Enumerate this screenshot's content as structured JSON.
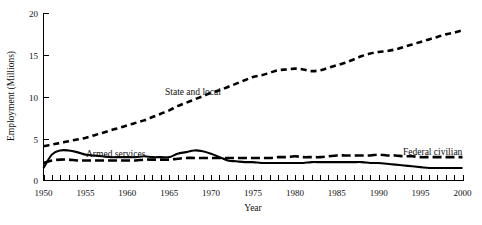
{
  "chart_data": {
    "type": "line",
    "title": "",
    "xlabel": "Year",
    "ylabel": "Employment (Millions)",
    "xlim": [
      1950,
      2000
    ],
    "ylim": [
      0,
      20
    ],
    "grid": false,
    "legend_position": "inline-annotations",
    "x_ticks_major": [
      1950,
      1955,
      1960,
      1965,
      1970,
      1975,
      1980,
      1985,
      1990,
      1995,
      2000
    ],
    "x_ticks_minor_step": 1,
    "y_ticks": [
      0,
      5,
      10,
      15,
      20
    ],
    "x_tick_labels": [
      "1950",
      "1955",
      "1960",
      "1965",
      "1970",
      "1975",
      "1980",
      "1985",
      "1990",
      "1995",
      "2000"
    ],
    "y_tick_labels": [
      "0",
      "5",
      "10",
      "15",
      "20"
    ],
    "x": [
      1950,
      1951,
      1952,
      1953,
      1954,
      1955,
      1956,
      1957,
      1958,
      1959,
      1960,
      1961,
      1962,
      1963,
      1964,
      1965,
      1966,
      1967,
      1968,
      1969,
      1970,
      1971,
      1972,
      1973,
      1974,
      1975,
      1976,
      1977,
      1978,
      1979,
      1980,
      1981,
      1982,
      1983,
      1984,
      1985,
      1986,
      1987,
      1988,
      1989,
      1990,
      1991,
      1992,
      1993,
      1994,
      1995,
      1996,
      1997,
      1998,
      1999,
      2000
    ],
    "series": [
      {
        "name": "State and local",
        "style": "dashed",
        "annotation": "State and local",
        "values": [
          4.1,
          4.3,
          4.5,
          4.7,
          4.9,
          5.1,
          5.4,
          5.7,
          6.0,
          6.3,
          6.6,
          6.9,
          7.2,
          7.6,
          8.0,
          8.4,
          8.9,
          9.3,
          9.7,
          10.1,
          10.5,
          10.8,
          11.2,
          11.6,
          12.0,
          12.4,
          12.6,
          12.9,
          13.2,
          13.3,
          13.4,
          13.3,
          13.1,
          13.2,
          13.5,
          13.8,
          14.1,
          14.5,
          14.9,
          15.2,
          15.4,
          15.5,
          15.7,
          16.0,
          16.3,
          16.6,
          16.9,
          17.2,
          17.5,
          17.7,
          18.0
        ]
      },
      {
        "name": "Armed services",
        "style": "solid",
        "annotation": "Armed services",
        "values": [
          1.5,
          3.1,
          3.6,
          3.6,
          3.4,
          3.1,
          3.0,
          2.9,
          2.8,
          2.8,
          2.8,
          2.8,
          2.9,
          2.8,
          2.8,
          2.8,
          3.2,
          3.4,
          3.6,
          3.5,
          3.2,
          2.8,
          2.4,
          2.3,
          2.2,
          2.2,
          2.1,
          2.1,
          2.1,
          2.1,
          2.1,
          2.1,
          2.2,
          2.2,
          2.2,
          2.2,
          2.2,
          2.2,
          2.2,
          2.1,
          2.1,
          2.0,
          1.9,
          1.8,
          1.7,
          1.6,
          1.5,
          1.5,
          1.5,
          1.5,
          1.5
        ]
      },
      {
        "name": "Federal civilian",
        "style": "dashed",
        "annotation": "Federal civilian",
        "values": [
          2.1,
          2.4,
          2.5,
          2.5,
          2.4,
          2.4,
          2.4,
          2.4,
          2.4,
          2.4,
          2.4,
          2.4,
          2.5,
          2.5,
          2.5,
          2.5,
          2.6,
          2.7,
          2.7,
          2.7,
          2.7,
          2.7,
          2.7,
          2.7,
          2.7,
          2.7,
          2.7,
          2.7,
          2.8,
          2.8,
          2.9,
          2.8,
          2.8,
          2.8,
          2.9,
          3.0,
          3.0,
          3.0,
          3.0,
          3.0,
          3.1,
          3.0,
          3.0,
          2.9,
          2.9,
          2.8,
          2.8,
          2.8,
          2.8,
          2.8,
          2.8
        ]
      }
    ]
  },
  "labels": {
    "y_axis_title": "Employment (Millions)",
    "x_axis_title": "Year",
    "state_and_local": "State and local",
    "armed_services": "Armed services",
    "federal_civilian": "Federal civilian",
    "y0": "0",
    "y5": "5",
    "y10": "10",
    "y15": "15",
    "y20": "20",
    "x1950": "1950",
    "x1955": "1955",
    "x1960": "1960",
    "x1965": "1965",
    "x1970": "1970",
    "x1975": "1975",
    "x1980": "1980",
    "x1985": "1985",
    "x1990": "1990",
    "x1995": "1995",
    "x2000": "2000"
  },
  "colors": {
    "ink": "#000000",
    "background": "#ffffff"
  }
}
